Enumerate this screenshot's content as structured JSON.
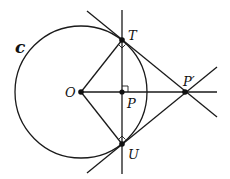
{
  "diagram": {
    "circle": {
      "name": "C",
      "label": "c",
      "center": [
        81,
        92
      ],
      "radius": 66
    },
    "points": {
      "O": {
        "label": "O",
        "x": 81,
        "y": 92
      },
      "P": {
        "label": "P",
        "x": 122,
        "y": 92
      },
      "T": {
        "label": "T",
        "x": 122,
        "y": 40
      },
      "U": {
        "label": "U",
        "x": 122,
        "y": 144
      },
      "Pprime": {
        "label": "P′",
        "x": 185,
        "y": 92
      }
    },
    "lines": [
      {
        "name": "vertical-line-TU",
        "from": [
          122,
          10
        ],
        "to": [
          122,
          174
        ]
      },
      {
        "name": "horizontal-line-OP",
        "from": [
          81,
          92
        ],
        "to": [
          217,
          92
        ]
      },
      {
        "name": "tangent-line-T",
        "from": [
          87,
          11
        ],
        "to": [
          217,
          117
        ]
      },
      {
        "name": "tangent-line-U",
        "from": [
          87,
          173
        ],
        "to": [
          217,
          67
        ]
      },
      {
        "name": "segment-OT",
        "from": [
          81,
          92
        ],
        "to": [
          122,
          40
        ]
      },
      {
        "name": "segment-OU",
        "from": [
          81,
          92
        ],
        "to": [
          122,
          144
        ]
      }
    ],
    "colors": {
      "stroke": "#1a1a1a",
      "background": "#ffffff"
    }
  }
}
